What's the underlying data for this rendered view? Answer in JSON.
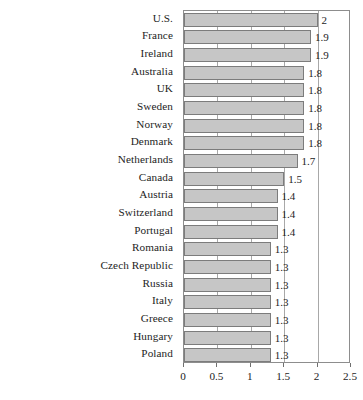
{
  "chart_data": {
    "type": "bar",
    "orientation": "horizontal",
    "title": "",
    "subtitle": "",
    "xlabel": "",
    "ylabel": "",
    "xlim": [
      0,
      2.5
    ],
    "xticks": [
      "0",
      "0.5",
      "1",
      "1.5",
      "2",
      "2.5"
    ],
    "xtick_values": [
      0,
      0.5,
      1,
      1.5,
      2,
      2.5
    ],
    "grid": true,
    "legend": null,
    "categories": [
      "U.S.",
      "France",
      "Ireland",
      "Australia",
      "UK",
      "Sweden",
      "Norway",
      "Denmark",
      "Netherlands",
      "Canada",
      "Austria",
      "Switzerland",
      "Portugal",
      "Romania",
      "Czech Republic",
      "Russia",
      "Italy",
      "Greece",
      "Hungary",
      "Poland"
    ],
    "values": [
      2,
      1.9,
      1.9,
      1.8,
      1.8,
      1.8,
      1.8,
      1.8,
      1.7,
      1.5,
      1.4,
      1.4,
      1.4,
      1.3,
      1.3,
      1.3,
      1.3,
      1.3,
      1.3,
      1.3
    ],
    "data_labels": [
      "2",
      "1.9",
      "1.9",
      "1.8",
      "1.8",
      "1.8",
      "1.8",
      "1.8",
      "1.7",
      "1.5",
      "1.4",
      "1.4",
      "1.4",
      "1.3",
      "1.3",
      "1.3",
      "1.3",
      "1.3",
      "1.3",
      "1.3"
    ],
    "bar_fill_color": "#c6c6c6",
    "bar_border_color": "#7c7c7c",
    "gridline_color": "#a8a8a8",
    "frame_color": "#8d8d8d",
    "text_color": "#1d1d1d"
  }
}
